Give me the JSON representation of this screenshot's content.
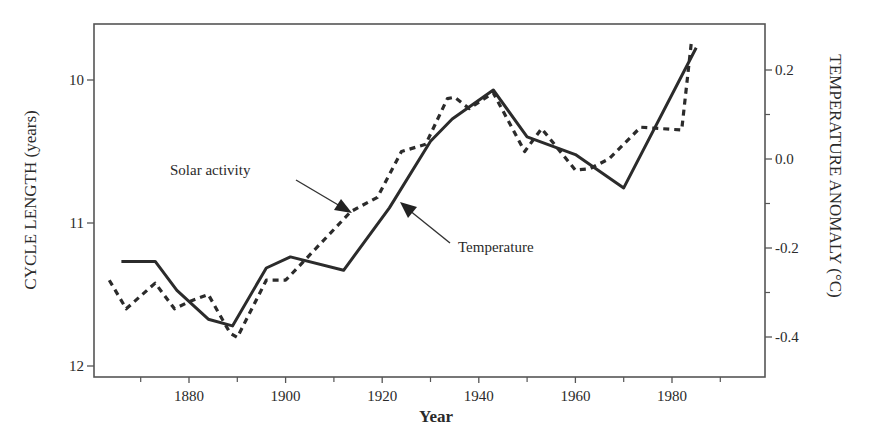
{
  "chart_data": {
    "type": "line",
    "title": "",
    "xlabel": "Year",
    "ylabel": "CYCLE LENGTH (years)",
    "ylabel_right": "TEMPERATURE ANOMALY (°C)",
    "xlim": [
      1860,
      2000
    ],
    "ylim": [
      12.0,
      9.6
    ],
    "ylim_right": [
      -0.5,
      0.3
    ],
    "x_ticks": [
      1880,
      1900,
      1920,
      1940,
      1960,
      1980
    ],
    "x_minor_ticks": [
      1870,
      1890,
      1910,
      1930,
      1950,
      1970,
      1990
    ],
    "y_ticks": [
      10,
      11,
      12
    ],
    "y_tick_labels": [
      "10",
      "11",
      "12"
    ],
    "y_right_ticks": [
      0.2,
      0.0,
      -0.2,
      -0.4
    ],
    "y_right_tick_labels": [
      "0.2",
      "0.0",
      "-0.2",
      "-0.4"
    ],
    "y_right_minor_ticks": [
      0.1,
      -0.1,
      -0.3
    ],
    "grid": false,
    "legend": "none (inline annotations)",
    "annotations": [
      {
        "text": "Solar activity",
        "points_to": "dashed series"
      },
      {
        "text": "Temperature",
        "points_to": "solid series"
      }
    ],
    "series": [
      {
        "name": "Solar activity",
        "axis": "left",
        "unit": "cycle length (years), inverted axis",
        "style": "dashed",
        "x": [
          1863.5,
          1867,
          1873,
          1877,
          1880,
          1884,
          1888.5,
          1890,
          1896,
          1900,
          1902,
          1913.5,
          1919,
          1924,
          1929,
          1933.5,
          1935,
          1938,
          1943,
          1949.5,
          1953,
          1960,
          1963,
          1967,
          1973.5,
          1982,
          1984
        ],
        "values": [
          11.4,
          11.6,
          11.42,
          11.6,
          11.55,
          11.5,
          11.77,
          11.8,
          11.4,
          11.4,
          11.33,
          10.92,
          10.82,
          10.5,
          10.45,
          10.13,
          10.12,
          10.2,
          10.09,
          10.5,
          10.34,
          10.63,
          10.62,
          10.55,
          10.33,
          10.35,
          9.74
        ]
      },
      {
        "name": "Temperature",
        "axis": "right",
        "unit": "°C anomaly",
        "style": "solid",
        "x": [
          1866,
          1873,
          1877.5,
          1884,
          1889,
          1896,
          1901,
          1912,
          1921.5,
          1930,
          1934.5,
          1943,
          1950,
          1960,
          1970,
          1985
        ],
        "values": [
          -0.23,
          -0.23,
          -0.295,
          -0.36,
          -0.375,
          -0.245,
          -0.22,
          -0.25,
          -0.11,
          0.04,
          0.09,
          0.155,
          0.05,
          0.01,
          -0.065,
          0.25
        ]
      }
    ]
  },
  "labels": {
    "x_axis_title": "Year",
    "y_left_title": "CYCLE LENGTH (years)",
    "y_right_title": "TEMPERATURE ANOMALY (°C)",
    "solar_label": "Solar activity",
    "temp_label": "Temperature"
  },
  "colors": {
    "line": "#2b2b2b",
    "frame": "#555555",
    "text": "#2a2a2a"
  }
}
